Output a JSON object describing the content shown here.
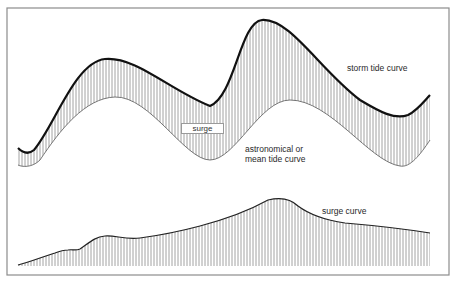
{
  "diagram": {
    "labels": {
      "storm_tide": "storm tide curve",
      "surge_box": "surge",
      "mean_tide_line1": "astronomical or",
      "mean_tide_line2": "mean tide curve",
      "surge_curve": "surge curve"
    },
    "colors": {
      "frame": "#8c8c8c",
      "storm_curve": "#111111",
      "mean_curve": "#555555",
      "hatch": "#8a8a8a",
      "text": "#2a2a2a"
    }
  }
}
